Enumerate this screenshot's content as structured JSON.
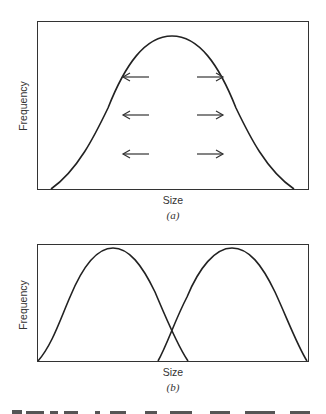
{
  "figure": {
    "panel_a": {
      "caption": "(a)",
      "x_label": "Size",
      "y_label": "Frequency",
      "description": "Single unimodal distribution with arrows pointing outward from the center (disruptive selection pressure)",
      "arrows": [
        {
          "direction": "left",
          "row": 1
        },
        {
          "direction": "right",
          "row": 1
        },
        {
          "direction": "left",
          "row": 2
        },
        {
          "direction": "right",
          "row": 2
        },
        {
          "direction": "left",
          "row": 3
        },
        {
          "direction": "right",
          "row": 3
        }
      ]
    },
    "panel_b": {
      "caption": "(b)",
      "x_label": "Size",
      "y_label": "Frequency",
      "description": "Two overlapping unimodal distributions (bimodal outcome)"
    },
    "cut_off_caption_text": ""
  }
}
